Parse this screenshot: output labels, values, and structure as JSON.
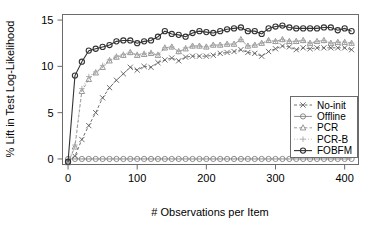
{
  "chart_data": {
    "type": "line",
    "title": "",
    "xlabel": "# Observations per Item",
    "ylabel": "% Lift in Test Log-Likelihood",
    "xlim": [
      -8,
      420
    ],
    "ylim": [
      -0.6,
      15.6
    ],
    "xticks": [
      0,
      100,
      200,
      300,
      400
    ],
    "xticklabels": [
      "0",
      "100",
      "200",
      "300",
      "400"
    ],
    "yticks": [
      0,
      5,
      10,
      15
    ],
    "yticklabels": [
      "0",
      "5",
      "10",
      "15"
    ],
    "grid": false,
    "legend_position": "lower right",
    "x": [
      0,
      10,
      20,
      30,
      40,
      50,
      60,
      70,
      80,
      90,
      100,
      110,
      120,
      130,
      140,
      150,
      160,
      170,
      180,
      190,
      200,
      210,
      220,
      230,
      240,
      250,
      260,
      270,
      280,
      290,
      300,
      310,
      320,
      330,
      340,
      350,
      360,
      370,
      380,
      390,
      400,
      410
    ],
    "series": [
      {
        "name": "No-init",
        "marker": "x",
        "linestyle": "dashed",
        "color": "#555555",
        "values": [
          -0.3,
          0.3,
          2.1,
          3.6,
          5.0,
          6.6,
          7.7,
          8.5,
          9.2,
          9.9,
          9.6,
          10.0,
          9.9,
          10.4,
          10.7,
          10.9,
          10.6,
          11.0,
          11.1,
          11.1,
          11.1,
          11.2,
          11.4,
          11.5,
          11.6,
          11.8,
          11.5,
          11.4,
          11.1,
          11.6,
          11.9,
          12.2,
          12.1,
          11.8,
          12.0,
          11.9,
          12.0,
          12.0,
          12.0,
          12.0,
          12.0,
          11.8
        ]
      },
      {
        "name": "Offline",
        "marker": "circle",
        "linestyle": "solid",
        "color": "#777777",
        "values": [
          0,
          0,
          0,
          0,
          0,
          0,
          0,
          0,
          0,
          0,
          0,
          0,
          0,
          0,
          0,
          0,
          0,
          0,
          0,
          0,
          0,
          0,
          0,
          0,
          0,
          0,
          0,
          0,
          0,
          0,
          0,
          0,
          0,
          0,
          0,
          0,
          0,
          0,
          0,
          0,
          0,
          0
        ]
      },
      {
        "name": "PCR",
        "marker": "triangle",
        "linestyle": "dashed",
        "color": "#888888",
        "values": [
          -0.4,
          1.3,
          7.3,
          8.6,
          9.3,
          9.9,
          10.6,
          11.0,
          11.2,
          11.5,
          11.2,
          11.3,
          11.4,
          11.2,
          12.0,
          12.1,
          11.6,
          11.9,
          12.2,
          12.2,
          12.1,
          12.3,
          12.3,
          12.4,
          12.4,
          12.9,
          12.2,
          12.3,
          12.5,
          12.8,
          12.7,
          12.9,
          12.7,
          12.7,
          12.8,
          12.5,
          12.7,
          12.8,
          12.5,
          12.6,
          12.6,
          12.5
        ]
      },
      {
        "name": "PCR-B",
        "marker": "plus",
        "linestyle": "dotted",
        "color": "#aaaaaa",
        "values": [
          -0.4,
          1.5,
          7.6,
          8.9,
          9.4,
          10.1,
          10.7,
          11.1,
          11.3,
          11.5,
          11.3,
          11.4,
          11.5,
          11.3,
          12.0,
          12.1,
          11.6,
          12.0,
          12.2,
          12.2,
          12.1,
          12.3,
          12.3,
          12.4,
          12.4,
          12.9,
          12.2,
          12.3,
          12.5,
          12.8,
          12.7,
          12.9,
          12.7,
          12.7,
          12.8,
          12.5,
          12.7,
          12.8,
          12.5,
          12.6,
          12.6,
          12.5
        ]
      },
      {
        "name": "FOBFM",
        "marker": "circle",
        "linestyle": "solid",
        "color": "#333333",
        "values": [
          -0.3,
          9.0,
          10.5,
          11.7,
          11.9,
          12.1,
          12.3,
          12.7,
          12.8,
          12.8,
          12.5,
          12.7,
          12.8,
          13.2,
          13.8,
          13.5,
          13.4,
          13.2,
          13.6,
          13.8,
          13.7,
          13.6,
          13.8,
          14.0,
          14.1,
          14.2,
          13.8,
          13.8,
          13.5,
          14.1,
          14.3,
          14.4,
          14.2,
          14.1,
          14.1,
          14.1,
          14.1,
          14.2,
          14.2,
          13.9,
          14.1,
          13.8
        ]
      }
    ]
  },
  "legend": {
    "items": [
      {
        "label": "No-init"
      },
      {
        "label": "Offline"
      },
      {
        "label": "PCR"
      },
      {
        "label": "PCR-B"
      },
      {
        "label": "FOBFM"
      }
    ]
  }
}
